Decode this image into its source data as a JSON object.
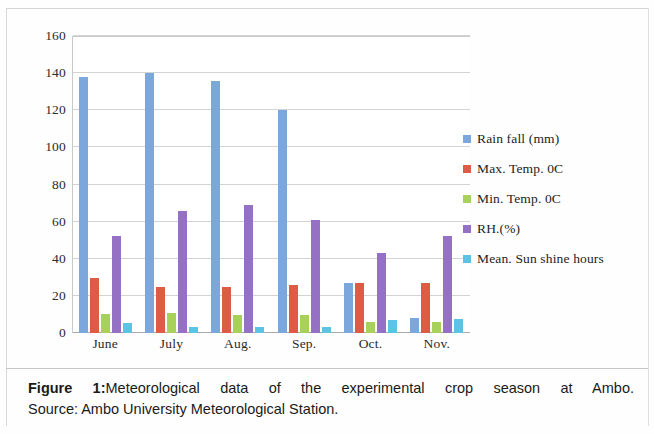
{
  "chart_data": {
    "type": "bar",
    "title": "",
    "xlabel": "",
    "ylabel": "",
    "ylim": [
      0,
      160
    ],
    "yticks": [
      0,
      20,
      40,
      60,
      80,
      100,
      120,
      140,
      160
    ],
    "grid": true,
    "legend_position": "right",
    "categories": [
      "June",
      "July",
      "Aug.",
      "Sep.",
      "Oct.",
      "Nov."
    ],
    "series": [
      {
        "name": "Rain fall (mm)",
        "color": "#7BA7DD",
        "values": [
          138,
          140,
          136,
          120,
          27,
          8
        ]
      },
      {
        "name": "Max. Temp. 0C",
        "color": "#DE5B45",
        "values": [
          29.5,
          25,
          25,
          26,
          27,
          27
        ]
      },
      {
        "name": "Min. Temp. 0C",
        "color": "#A8D159",
        "values": [
          10.5,
          11,
          9.5,
          9.5,
          6,
          6
        ]
      },
      {
        "name": "RH.(%)",
        "color": "#9471C4",
        "values": [
          52,
          66,
          69,
          61,
          43,
          52
        ]
      },
      {
        "name": "Mean. Sun shine hours",
        "color": "#5BC4E5",
        "values": [
          5.5,
          3,
          3.5,
          3,
          7,
          7.5
        ]
      }
    ]
  },
  "caption": {
    "figure_label": "Figure 1:",
    "line1": "Meteorological data of the experimental crop season at Ambo.",
    "line2": "Source: Ambo University Meteorological Station."
  }
}
